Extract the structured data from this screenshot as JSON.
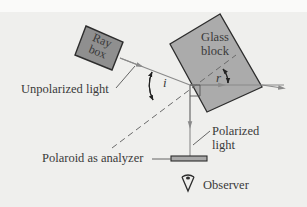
{
  "figure": {
    "labels": {
      "ray_box_line1": "Ray",
      "ray_box_line2": "box",
      "glass_line1": "Glass",
      "glass_line2": "block",
      "unpolarized": "Unpolarized light",
      "angle_i": "i",
      "angle_r": "r",
      "polarized_line1": "Polarized",
      "polarized_line2": "light",
      "analyzer": "Polaroid as analyzer",
      "observer": "Observer"
    },
    "icons": {
      "observer_eye": "eye-icon"
    },
    "colors": {
      "background": "#efefed",
      "block_fill": "#a9a9a9",
      "ray_box_fill": "#8f8f8f",
      "line": "#7a7a7a",
      "outline": "#2d2d2d",
      "text": "#3a3a3a"
    }
  }
}
